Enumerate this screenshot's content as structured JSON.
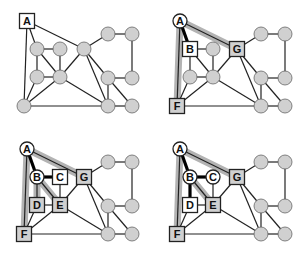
{
  "diagram": {
    "colors": {
      "edge": "#222222",
      "node_fill": "#d0d0d0",
      "node_stroke": "#222222",
      "visited_fill": "#ffffff",
      "frontier_fill": "#d0d0d0",
      "highlight": "#9a9a9a",
      "tree_edge": "#000000"
    },
    "base_nodes": {
      "A": [
        27,
        21
      ],
      "B": [
        37,
        49
      ],
      "C": [
        60,
        49
      ],
      "G": [
        84,
        49
      ],
      "D": [
        37,
        77
      ],
      "E": [
        60,
        77
      ],
      "F": [
        24,
        106
      ],
      "R1": [
        108,
        34
      ],
      "R2": [
        132,
        34
      ],
      "R3": [
        108,
        78
      ],
      "R4": [
        132,
        78
      ],
      "R5": [
        108,
        106
      ],
      "R6": [
        132,
        106
      ]
    },
    "edges": [
      [
        "A",
        "B"
      ],
      [
        "A",
        "G"
      ],
      [
        "A",
        "F"
      ],
      [
        "B",
        "C"
      ],
      [
        "B",
        "D"
      ],
      [
        "B",
        "E"
      ],
      [
        "C",
        "E"
      ],
      [
        "D",
        "E"
      ],
      [
        "D",
        "F"
      ],
      [
        "F",
        "E"
      ],
      [
        "F",
        "R5"
      ],
      [
        "E",
        "G"
      ],
      [
        "E",
        "R5"
      ],
      [
        "G",
        "R1"
      ],
      [
        "G",
        "R3"
      ],
      [
        "G",
        "R5"
      ],
      [
        "R1",
        "R2"
      ],
      [
        "R2",
        "R4"
      ],
      [
        "R3",
        "R4"
      ],
      [
        "R3",
        "R5"
      ],
      [
        "R3",
        "R6"
      ],
      [
        "R5",
        "R6"
      ]
    ],
    "panels": [
      {
        "id": "step-1",
        "offset": [
          0,
          0
        ],
        "labels": {
          "A": "A"
        },
        "shapes": {
          "A": "square-white"
        },
        "highlight_paths": [],
        "tree_edges": []
      },
      {
        "id": "step-2",
        "offset": [
          153,
          0
        ],
        "labels": {
          "A": "A",
          "B": "B",
          "G": "G",
          "F": "F"
        },
        "shapes": {
          "A": "circle-white",
          "B": "square-white",
          "G": "square-gray",
          "F": "square-gray"
        },
        "highlight_paths": [
          [
            "A",
            "G"
          ],
          [
            "A",
            "F"
          ]
        ],
        "tree_edges": [
          [
            "A",
            "B"
          ]
        ]
      },
      {
        "id": "step-3",
        "offset": [
          0,
          128
        ],
        "labels": {
          "A": "A",
          "B": "B",
          "C": "C",
          "D": "D",
          "E": "E",
          "G": "G",
          "F": "F"
        },
        "shapes": {
          "A": "circle-white",
          "B": "circle-white",
          "C": "square-white",
          "D": "square-gray",
          "E": "square-gray",
          "G": "square-gray",
          "F": "square-gray"
        },
        "highlight_paths": [
          [
            "A",
            "G"
          ],
          [
            "A",
            "F"
          ],
          [
            "B",
            "D"
          ],
          [
            "B",
            "E"
          ]
        ],
        "tree_edges": [
          [
            "A",
            "B"
          ],
          [
            "B",
            "C"
          ]
        ]
      },
      {
        "id": "step-4",
        "offset": [
          153,
          128
        ],
        "labels": {
          "A": "A",
          "B": "B",
          "C": "C",
          "D": "D",
          "E": "E",
          "G": "G",
          "F": "F"
        },
        "shapes": {
          "A": "circle-white",
          "B": "circle-white",
          "C": "circle-white",
          "D": "square-white",
          "E": "square-gray",
          "G": "square-gray",
          "F": "square-gray"
        },
        "highlight_paths": [
          [
            "A",
            "G"
          ],
          [
            "A",
            "F"
          ],
          [
            "B",
            "E"
          ]
        ],
        "tree_edges": [
          [
            "A",
            "B"
          ],
          [
            "B",
            "C"
          ],
          [
            "B",
            "D"
          ]
        ]
      }
    ]
  }
}
